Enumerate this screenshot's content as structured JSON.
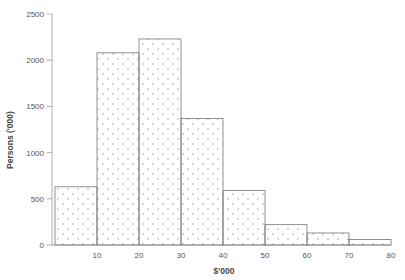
{
  "chart_data": {
    "type": "bar",
    "subtype": "histogram",
    "title": "",
    "xlabel": "$'000",
    "ylabel": "Persons ('000)",
    "bins": [
      [
        0,
        10
      ],
      [
        10,
        20
      ],
      [
        20,
        30
      ],
      [
        30,
        40
      ],
      [
        40,
        50
      ],
      [
        50,
        60
      ],
      [
        60,
        70
      ],
      [
        70,
        80
      ]
    ],
    "categories": [
      "0-10",
      "10-20",
      "20-30",
      "30-40",
      "40-50",
      "50-60",
      "60-70",
      "70-80"
    ],
    "values": [
      630,
      2080,
      2230,
      1370,
      590,
      220,
      130,
      60
    ],
    "ylim": [
      0,
      2500
    ],
    "xlim": [
      0,
      80
    ],
    "yticks": [
      0,
      500,
      1000,
      1500,
      2000,
      2500
    ],
    "xticks": [
      10,
      20,
      30,
      40,
      50,
      60,
      70,
      80
    ],
    "grid": false,
    "legend": null,
    "bar_fill": "dotted pattern",
    "colors": {
      "bar_stroke": "#777777",
      "dot": "#888888",
      "axis": "#999999"
    }
  }
}
